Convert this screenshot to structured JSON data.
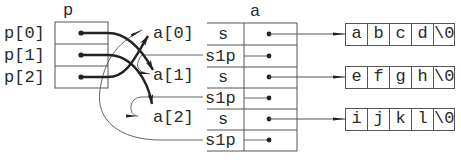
{
  "diagram": {
    "pointer_array": {
      "name": "p",
      "elements": [
        "p[0]",
        "p[1]",
        "p[2]"
      ]
    },
    "struct_array": {
      "name": "a",
      "elements": [
        "a[0]",
        "a[1]",
        "a[2]"
      ],
      "fields": [
        [
          "s",
          "s1p"
        ],
        [
          "s",
          "s1p"
        ],
        [
          "s",
          "s1p"
        ]
      ]
    },
    "strings": [
      [
        "a",
        "b",
        "c",
        "d",
        "\\0"
      ],
      [
        "e",
        "f",
        "g",
        "h",
        "\\0"
      ],
      [
        "i",
        "j",
        "k",
        "l",
        "\\0"
      ]
    ],
    "edges": [
      {
        "from": "p[0]",
        "to": "a[1]",
        "style": "thick"
      },
      {
        "from": "p[1]",
        "to": "a[2]",
        "style": "thick"
      },
      {
        "from": "p[2]",
        "to": "a[0]",
        "style": "thick"
      },
      {
        "from": "a[0].s1p",
        "to": "a[1]",
        "style": "thin"
      },
      {
        "from": "a[1].s1p",
        "to": "a[2]",
        "style": "thin"
      },
      {
        "from": "a[2].s1p",
        "to": "a[0]",
        "style": "thin"
      },
      {
        "from": "a[0].s",
        "to": "abcd",
        "style": "thin"
      },
      {
        "from": "a[1].s",
        "to": "efgh",
        "style": "thin"
      },
      {
        "from": "a[2].s",
        "to": "ijkl",
        "style": "thin"
      }
    ]
  }
}
